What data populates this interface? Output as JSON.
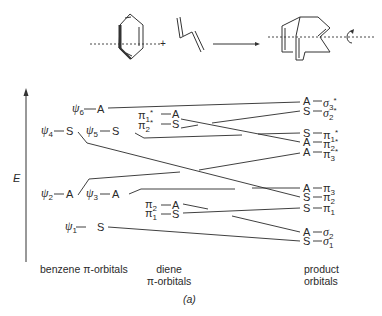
{
  "reaction": {
    "plus": "+",
    "arrow": "reaction-arrow",
    "rotation": "C2-rotation-axis"
  },
  "axis": {
    "label": "E"
  },
  "benzene_orbitals": [
    {
      "name": "ψ6",
      "base": "ψ",
      "sub": "6",
      "sym": "A"
    },
    {
      "name": "ψ4",
      "base": "ψ",
      "sub": "4",
      "sym": "S"
    },
    {
      "name": "ψ5",
      "base": "ψ",
      "sub": "5",
      "sym": "S"
    },
    {
      "name": "ψ2",
      "base": "ψ",
      "sub": "2",
      "sym": "A"
    },
    {
      "name": "ψ3",
      "base": "ψ",
      "sub": "3",
      "sym": "A"
    },
    {
      "name": "ψ1",
      "base": "ψ",
      "sub": "1",
      "sym": "S"
    }
  ],
  "diene_orbitals": [
    {
      "name": "π1*",
      "base": "π",
      "sub": "1",
      "sup": "*",
      "sym": "A"
    },
    {
      "name": "π2*",
      "base": "π",
      "sub": "2",
      "sup": "*",
      "sym": "S"
    },
    {
      "name": "π2",
      "base": "π",
      "sub": "2",
      "sup": "",
      "sym": "A"
    },
    {
      "name": "π1",
      "base": "π",
      "sub": "1",
      "sup": "",
      "sym": "S"
    }
  ],
  "product_orbitals": [
    {
      "name": "σ3*",
      "base": "σ",
      "sub": "3",
      "sup": "*",
      "sym": "A"
    },
    {
      "name": "σ2*",
      "base": "σ",
      "sub": "2",
      "sup": "*",
      "sym": "S"
    },
    {
      "name": "π1*",
      "base": "π",
      "sub": "1",
      "sup": "*",
      "sym": "S"
    },
    {
      "name": "π2*",
      "base": "π",
      "sub": "2",
      "sup": "*",
      "sym": "A"
    },
    {
      "name": "π3*",
      "base": "π",
      "sub": "3",
      "sup": "*",
      "sym": "A"
    },
    {
      "name": "π3",
      "base": "π",
      "sub": "3",
      "sup": "",
      "sym": "A"
    },
    {
      "name": "π2",
      "base": "π",
      "sub": "2",
      "sup": "",
      "sym": "S"
    },
    {
      "name": "π1",
      "base": "π",
      "sub": "1",
      "sup": "",
      "sym": "S"
    },
    {
      "name": "σ2",
      "base": "σ",
      "sub": "2",
      "sup": "",
      "sym": "A"
    },
    {
      "name": "σ1",
      "base": "σ",
      "sub": "1",
      "sup": "",
      "sym": "S"
    }
  ],
  "captions": {
    "benzene": "benzene π-orbitals",
    "diene_line1": "diene",
    "diene_line2": "π-orbitals",
    "product_line1": "product",
    "product_line2": "orbitals",
    "panel": "(a)"
  }
}
